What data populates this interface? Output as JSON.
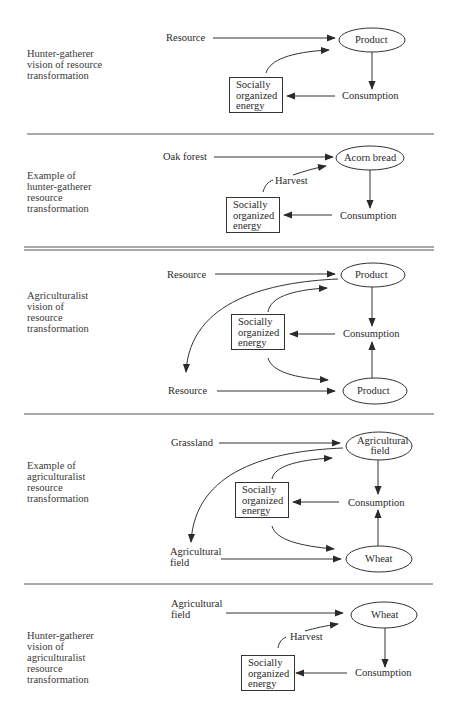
{
  "panels": [
    {
      "side_label": [
        "Hunter-gatherer",
        "vision of resource",
        "transformation"
      ],
      "input_top": "Resource",
      "product_top": "Product",
      "consumption": "Consumption",
      "energy_box": [
        "Socially",
        "organized",
        "energy"
      ]
    },
    {
      "side_label": [
        "Example of",
        "hunter-gatherer",
        "resource",
        "transformation"
      ],
      "input_top": "Oak forest",
      "product_top": "Acorn bread",
      "arrow_label": "Harvest",
      "consumption": "Consumption",
      "energy_box": [
        "Socially",
        "organized",
        "energy"
      ]
    },
    {
      "side_label": [
        "Agriculturalist",
        "vision of",
        "resource",
        "transformation"
      ],
      "input_top": "Resource",
      "product_top": "Product",
      "consumption": "Consumption",
      "energy_box": [
        "Socially",
        "organized",
        "energy"
      ],
      "input_bottom": "Resource",
      "product_bottom": "Product"
    },
    {
      "side_label": [
        "Example of",
        "agriculturalist",
        "resource",
        "transformation"
      ],
      "input_top": "Grassland",
      "product_top": [
        "Agricultural",
        "field"
      ],
      "consumption": "Consumption",
      "energy_box": [
        "Socially",
        "organized",
        "energy"
      ],
      "input_bottom": [
        "Agricultural",
        "field"
      ],
      "product_bottom": "Wheat"
    },
    {
      "side_label": [
        "Hunter-gatherer",
        "vision of",
        "agriculturalist",
        "resource",
        "transformation"
      ],
      "input_top": [
        "Agricultural",
        "field"
      ],
      "product_top": "Wheat",
      "arrow_label": "Harvest",
      "consumption": "Consumption",
      "energy_box": [
        "Socially",
        "organized",
        "energy"
      ]
    }
  ],
  "colors": {
    "line": "#333333",
    "text": "#2a2a2a",
    "background": "#ffffff"
  }
}
